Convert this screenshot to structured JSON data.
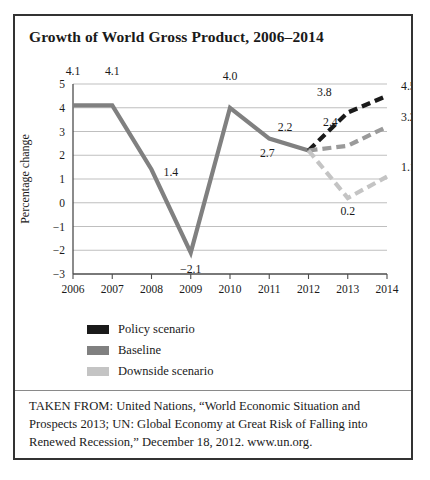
{
  "figure": {
    "title": "Growth of World Gross Product, 2006–2014",
    "source_note": "TAKEN FROM: United Nations, “World Economic Situation and Prospects 2013; UN: Global Economy at Great Risk of Falling into Renewed Recession,” December 18, 2012. www.un.org."
  },
  "legend": {
    "position": "below-plot-left",
    "items": [
      {
        "label": "Policy scenario",
        "color": "#1a1a1a"
      },
      {
        "label": "Baseline",
        "color": "#808080"
      },
      {
        "label": "Downside scenario",
        "color": "#c4c4c4"
      }
    ]
  },
  "chart_data": {
    "type": "line",
    "title": "Growth of World Gross Product, 2006–2014",
    "xlabel": "Year",
    "ylabel": "Percentage change",
    "x": [
      2006,
      2007,
      2008,
      2009,
      2010,
      2011,
      2012,
      2013,
      2014
    ],
    "xticklabels": [
      "2006",
      "2007",
      "2008",
      "2009",
      "2010",
      "2011",
      "2012",
      "2013",
      "2014"
    ],
    "yticks": [
      -3,
      -2,
      -1,
      0,
      1,
      2,
      3,
      4,
      5
    ],
    "yticklabels": [
      "−3",
      "−2",
      "−1",
      "0",
      "1",
      "2",
      "3",
      "4",
      "5"
    ],
    "ylim": [
      -3,
      5
    ],
    "xlim": [
      2006,
      2014
    ],
    "grid": "horizontal",
    "series": [
      {
        "name": "Baseline historical",
        "color": "#808080",
        "style": "solid",
        "width": 4.2,
        "x": [
          2006,
          2007,
          2008,
          2009,
          2010,
          2011,
          2012
        ],
        "values": [
          4.1,
          4.1,
          1.4,
          -2.1,
          4.0,
          2.7,
          2.2
        ],
        "labels": [
          "4.1",
          "4.1",
          "1.4",
          "−2.1",
          "4.0",
          "2.7",
          "2.2"
        ]
      },
      {
        "name": "Policy scenario",
        "color": "#1a1a1a",
        "style": "dashed",
        "width": 4.2,
        "x": [
          2012,
          2013,
          2014
        ],
        "values": [
          2.2,
          3.8,
          4.5
        ],
        "labels": [
          "",
          "3.8",
          "4.5"
        ]
      },
      {
        "name": "Baseline",
        "color": "#9a9a9a",
        "style": "dashed",
        "width": 4.2,
        "x": [
          2012,
          2013,
          2014
        ],
        "values": [
          2.2,
          2.4,
          3.2
        ],
        "labels": [
          "",
          "2.4",
          "3.2"
        ]
      },
      {
        "name": "Downside scenario",
        "color": "#c4c4c4",
        "style": "dashed",
        "width": 4.2,
        "x": [
          2012,
          2013,
          2014
        ],
        "values": [
          2.2,
          0.2,
          1.1
        ],
        "labels": [
          "",
          "0.2",
          "1.1"
        ]
      }
    ],
    "point_labels": [
      {
        "text": "4.1",
        "x": 2006,
        "y": 4.1,
        "dx": 0,
        "dy": 30
      },
      {
        "text": "4.1",
        "x": 2007,
        "y": 4.1,
        "dx": 0,
        "dy": 30
      },
      {
        "text": "1.4",
        "x": 2008,
        "y": 1.4,
        "dx": 12,
        "dy": -6
      },
      {
        "text": "−2.1",
        "x": 2009,
        "y": -2.1,
        "dx": 0,
        "dy": -20
      },
      {
        "text": "4.0",
        "x": 2010,
        "y": 4.0,
        "dx": 0,
        "dy": 28
      },
      {
        "text": "2.7",
        "x": 2011,
        "y": 2.7,
        "dx": -2,
        "dy": -18
      },
      {
        "text": "2.2",
        "x": 2012,
        "y": 2.2,
        "dx": -16,
        "dy": 20
      },
      {
        "text": "3.8",
        "x": 2013,
        "y": 3.8,
        "dx": -16,
        "dy": 17
      },
      {
        "text": "4.5",
        "x": 2014,
        "y": 4.5,
        "dx": 14,
        "dy": 6
      },
      {
        "text": "2.4",
        "x": 2013,
        "y": 2.4,
        "dx": -10,
        "dy": 20
      },
      {
        "text": "3.2",
        "x": 2014,
        "y": 3.2,
        "dx": 14,
        "dy": 6
      },
      {
        "text": "0.2",
        "x": 2013,
        "y": 0.2,
        "dx": 0,
        "dy": -17
      },
      {
        "text": "1.1",
        "x": 2014,
        "y": 1.1,
        "dx": 14,
        "dy": 6
      }
    ]
  }
}
